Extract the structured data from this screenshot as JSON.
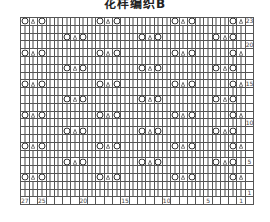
{
  "title": "花样编织B",
  "chart_data": {
    "type": "table",
    "title": "花样编织B",
    "columns": 27,
    "rows": 23,
    "legend": {
      "|": "knit",
      "O": "yarn over",
      "∧": "centered double decrease"
    },
    "row_labels": {
      "23": "23",
      "20": "20",
      "15": "15",
      "10": "10",
      "5": "5",
      "1": "1"
    },
    "stitch_labels": {
      "27": "27",
      "25": "25",
      "20": "20",
      "15": "15",
      "10": "10",
      "5": "5",
      "1": "1"
    },
    "pattern_rows": {
      "A": [
        27,
        26,
        25,
        18,
        17,
        16,
        9,
        8,
        7,
        2,
        1
      ],
      "B": [
        22,
        21,
        20,
        13,
        12,
        11,
        4,
        3,
        2
      ]
    },
    "motif_rows_A": [
      23,
      19,
      15,
      11,
      7,
      3
    ],
    "motif_rows_B": [
      21,
      17,
      13,
      9,
      5
    ]
  }
}
